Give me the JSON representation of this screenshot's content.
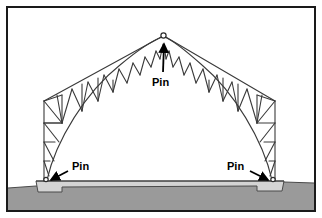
{
  "figure": {
    "type": "engineering-diagram",
    "border": {
      "color": "#1a1a1a",
      "width_px": 2,
      "inset_px": 6,
      "background": "#ffffff"
    },
    "colors": {
      "line": "#3a3a3a",
      "line_heavy": "#2b2b2b",
      "ground": "#9a9a9a",
      "ground_edge": "#4a4a4a",
      "pedestal": "#d4d4d4",
      "pedestal_edge": "#4a4a4a",
      "text": "#000000",
      "arrow": "#000000",
      "background": "#ffffff"
    },
    "labels": [
      {
        "id": "apex-pin",
        "text": "Pin",
        "text_x": 152,
        "text_y": 82,
        "arrow_from_x": 162,
        "arrow_from_y": 74,
        "arrow_to_x": 165,
        "arrow_to_y": 41,
        "description": "Pin connection at crown of arch"
      },
      {
        "id": "left-base-pin",
        "text": "Pin",
        "text_x": 72,
        "text_y": 168,
        "arrow_from_x": 70,
        "arrow_from_y": 170,
        "arrow_to_x": 48,
        "arrow_to_y": 180,
        "description": "Pin support at left base"
      },
      {
        "id": "right-base-pin",
        "text": "Pin",
        "text_x": 227,
        "text_y": 168,
        "arrow_from_x": 248,
        "arrow_from_y": 170,
        "arrow_to_x": 271,
        "arrow_to_y": 180,
        "description": "Pin support at right base"
      }
    ],
    "geometry": {
      "apex_x": 163,
      "apex_y": 35,
      "left_base_x": 44,
      "left_base_y": 181,
      "right_base_x": 275,
      "right_base_y": 181,
      "left_knee_x": 44,
      "left_knee_y": 101,
      "right_knee_x": 275,
      "right_knee_y": 101,
      "ground_top_left_y": 186,
      "ground_top_right_y": 183,
      "pedestal_top_y": 181,
      "pedestal_left_x": 36,
      "pedestal_right_x": 284
    }
  }
}
